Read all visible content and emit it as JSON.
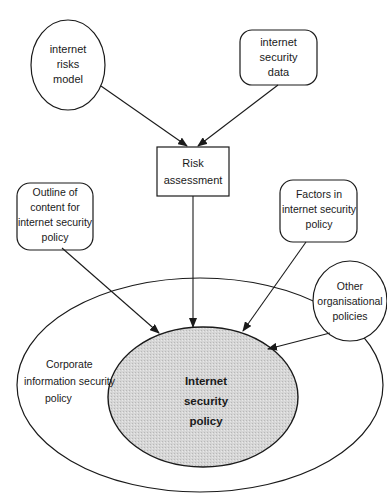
{
  "diagram": {
    "nodes": {
      "risks_model": {
        "lines": [
          "internet",
          "risks",
          "model"
        ],
        "shape": "circle"
      },
      "security_data": {
        "lines": [
          "internet",
          "security",
          "data"
        ],
        "shape": "rounded-rect"
      },
      "risk_assessment": {
        "lines": [
          "Risk",
          "assessment"
        ],
        "shape": "rect"
      },
      "outline_content": {
        "lines": [
          "Outline of",
          "content for",
          "internet security",
          "policy"
        ],
        "shape": "rounded-rect"
      },
      "factors": {
        "lines": [
          "Factors in",
          "internet security",
          "policy"
        ],
        "shape": "rounded-rect"
      },
      "other_policies": {
        "lines": [
          "Other",
          "organisational",
          "policies"
        ],
        "shape": "circle"
      },
      "corporate_policy": {
        "lines": [
          "Corporate",
          "information security",
          "policy"
        ],
        "shape": "ellipse"
      },
      "internet_policy": {
        "lines": [
          "Internet",
          "security",
          "policy"
        ],
        "shape": "ellipse-shaded"
      }
    },
    "edges": [
      {
        "from": "internet risks model",
        "to": "Risk assessment"
      },
      {
        "from": "internet security data",
        "to": "Risk assessment"
      },
      {
        "from": "Risk assessment",
        "to": "Internet security policy"
      },
      {
        "from": "Outline of content for internet security policy",
        "to": "Internet security policy"
      },
      {
        "from": "Factors in internet security policy",
        "to": "Internet security policy"
      },
      {
        "from": "Other organisational policies",
        "to": "Internet security policy"
      }
    ],
    "colors": {
      "stroke": "#1a1a1a",
      "shade": "#d4d4d4",
      "background": "#ffffff"
    }
  }
}
